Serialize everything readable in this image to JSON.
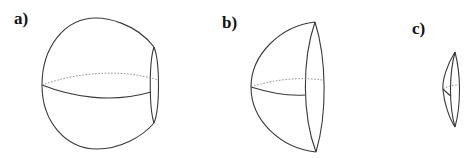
{
  "figure": {
    "panels": [
      {
        "id": "a",
        "label": "a)",
        "description": "Sphere truncated by a small cap on the right"
      },
      {
        "id": "b",
        "label": "b)",
        "description": "Hemisphere-like lens-shaped segment"
      },
      {
        "id": "c",
        "label": "c)",
        "description": "Thin lens-shaped spherical segment"
      }
    ],
    "colors": {
      "line": "#3a3a3a",
      "hidden_line": "#8a8a8a",
      "background": "#ffffff"
    }
  }
}
